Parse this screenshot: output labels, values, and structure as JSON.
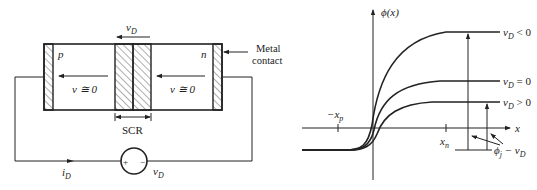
{
  "left_diagram": {
    "title": "p-n junction with applied voltage",
    "region_p_label": "p",
    "region_n_label": "n",
    "vd_top_label": "v",
    "vd_top_sub": "D",
    "field_left_label": "v ≅ 0",
    "field_right_label": "v ≅ 0",
    "scr_label": "SCR",
    "metal_contact_label_1": "Metal",
    "metal_contact_label_2": "contact",
    "current_label": "i",
    "current_sub": "D",
    "source_label": "v",
    "source_sub": "D",
    "source_plus": "+",
    "source_minus": "−"
  },
  "right_diagram": {
    "y_axis_label": "ϕ(x)",
    "x_axis_label": "x",
    "tick_neg_xp": "−x",
    "tick_neg_xp_sub": "p",
    "tick_xn": "x",
    "tick_xn_sub": "n",
    "curves": [
      {
        "label": "v",
        "sub": "D",
        "cond": " < 0",
        "level_y": 32
      },
      {
        "label": "v",
        "sub": "D",
        "cond": " = 0",
        "level_y": 81
      },
      {
        "label": "v",
        "sub": "D",
        "cond": " > 0",
        "level_y": 102
      }
    ],
    "barrier_label": "ϕ",
    "barrier_sub": "j",
    "barrier_rest": " − v",
    "barrier_rest_sub": "D"
  }
}
